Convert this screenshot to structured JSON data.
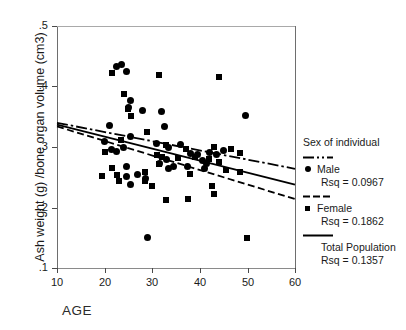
{
  "figure": {
    "xlabel": "AGE",
    "ylabel": "Ash weight (g) /bone organ volume (cm3)"
  },
  "legend": {
    "title": "Sex of individual",
    "male_label": "Male",
    "male_rsq": "Rsq = 0.0967",
    "female_label": "Female",
    "female_rsq": "Rsq = 0.1862",
    "total_label": "Total Population",
    "total_rsq": "Rsq = 0.1357"
  },
  "axes": {
    "x_ticks": [
      "10",
      "20",
      "30",
      "40",
      "50",
      "60"
    ],
    "y_ticks": [
      ".5",
      ".4",
      ".3",
      ".2",
      ".1"
    ]
  },
  "chart_data": {
    "type": "scatter",
    "title": "",
    "xlabel": "AGE",
    "ylabel": "Ash weight (g) /bone organ volume (cm3)",
    "xlim": [
      10,
      60
    ],
    "ylim": [
      0.1,
      0.5
    ],
    "xticks": [
      10,
      20,
      30,
      40,
      50,
      60
    ],
    "yticks": [
      0.1,
      0.2,
      0.3,
      0.4,
      0.5
    ],
    "grid": false,
    "legend_position": "right-outside",
    "series": [
      {
        "name": "Male",
        "marker": "filled-circle",
        "rsq": 0.0967,
        "fit_line_style": "dash-dot",
        "fit_line_endpoints": [
          [
            10,
            0.34
          ],
          [
            60,
            0.264
          ]
        ],
        "points": [
          [
            22.5,
            0.433
          ],
          [
            23.5,
            0.437
          ],
          [
            24.5,
            0.425
          ],
          [
            25.5,
            0.377
          ],
          [
            25.0,
            0.366
          ],
          [
            28.0,
            0.36
          ],
          [
            32.0,
            0.358
          ],
          [
            32.5,
            0.334
          ],
          [
            49.5,
            0.352
          ],
          [
            21.0,
            0.336
          ],
          [
            20.0,
            0.309
          ],
          [
            25.5,
            0.318
          ],
          [
            21.5,
            0.296
          ],
          [
            22.5,
            0.293
          ],
          [
            24.0,
            0.3
          ],
          [
            31.0,
            0.306
          ],
          [
            33.5,
            0.3
          ],
          [
            36.0,
            0.304
          ],
          [
            38.0,
            0.29
          ],
          [
            39.5,
            0.287
          ],
          [
            42.0,
            0.291
          ],
          [
            43.5,
            0.287
          ],
          [
            45.0,
            0.294
          ],
          [
            40.5,
            0.278
          ],
          [
            41.5,
            0.273
          ],
          [
            33.0,
            0.28
          ],
          [
            33.5,
            0.265
          ],
          [
            24.5,
            0.268
          ],
          [
            24.5,
            0.252
          ],
          [
            25.5,
            0.238
          ],
          [
            31.5,
            0.272
          ],
          [
            34.5,
            0.268
          ],
          [
            37.5,
            0.268
          ],
          [
            41.0,
            0.264
          ],
          [
            27.0,
            0.254
          ],
          [
            28.5,
            0.248
          ],
          [
            29.0,
            0.15
          ]
        ]
      },
      {
        "name": "Female",
        "marker": "filled-square",
        "rsq": 0.1862,
        "fit_line_style": "dashed",
        "fit_line_endpoints": [
          [
            10,
            0.334
          ],
          [
            60,
            0.214
          ]
        ],
        "points": [
          [
            21.5,
            0.423
          ],
          [
            31.5,
            0.419
          ],
          [
            44.0,
            0.416
          ],
          [
            24.0,
            0.387
          ],
          [
            25.0,
            0.363
          ],
          [
            25.5,
            0.352
          ],
          [
            29.0,
            0.325
          ],
          [
            23.5,
            0.312
          ],
          [
            33.0,
            0.303
          ],
          [
            37.0,
            0.297
          ],
          [
            43.0,
            0.3
          ],
          [
            46.5,
            0.297
          ],
          [
            48.5,
            0.29
          ],
          [
            20.0,
            0.292
          ],
          [
            31.0,
            0.286
          ],
          [
            32.0,
            0.283
          ],
          [
            35.5,
            0.281
          ],
          [
            39.0,
            0.283
          ],
          [
            42.0,
            0.28
          ],
          [
            44.0,
            0.276
          ],
          [
            31.5,
            0.272
          ],
          [
            21.5,
            0.266
          ],
          [
            22.5,
            0.254
          ],
          [
            23.0,
            0.243
          ],
          [
            28.5,
            0.258
          ],
          [
            28.5,
            0.244
          ],
          [
            19.5,
            0.252
          ],
          [
            30.0,
            0.235
          ],
          [
            45.5,
            0.262
          ],
          [
            48.5,
            0.258
          ],
          [
            38.0,
            0.255
          ],
          [
            42.5,
            0.236
          ],
          [
            43.0,
            0.222
          ],
          [
            33.0,
            0.212
          ],
          [
            37.5,
            0.214
          ],
          [
            50.0,
            0.15
          ]
        ]
      },
      {
        "name": "Total Population",
        "marker": "none",
        "rsq": 0.1357,
        "fit_line_style": "solid",
        "fit_line_endpoints": [
          [
            10,
            0.337
          ],
          [
            60,
            0.238
          ]
        ]
      }
    ]
  }
}
